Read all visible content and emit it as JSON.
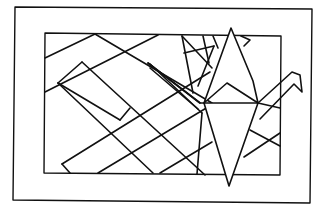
{
  "illustration": {
    "title": "Origami crane over geometric line pattern",
    "subject": "origami-crane",
    "style": "black line art on white",
    "colors": {
      "line": "#111111",
      "background": "#ffffff"
    }
  }
}
